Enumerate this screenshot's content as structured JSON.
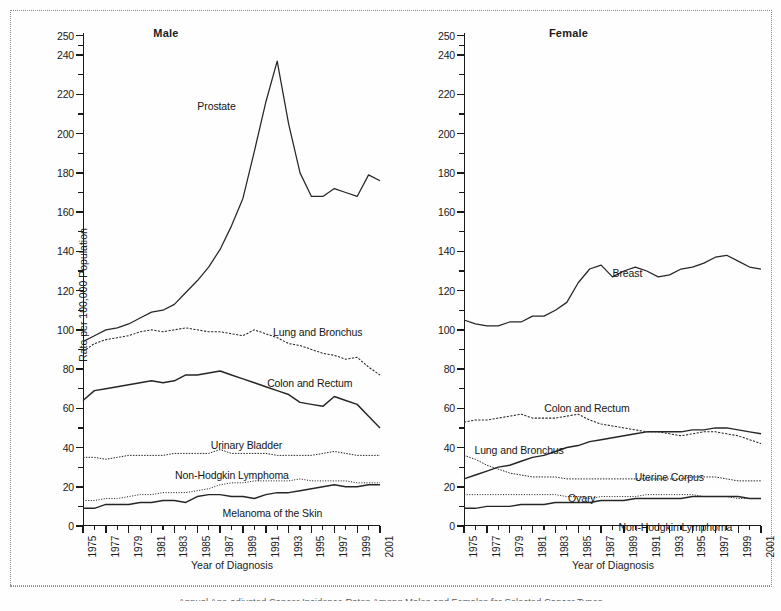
{
  "figure": {
    "caption": "Annual Age-adjusted Cancer Incidence Rates Among Males and Females for Selected Cancer Types",
    "y_axis_title": "Rate per 100,000 Population",
    "x_axis_title": "Year of Diagnosis",
    "panels": [
      {
        "title": "Male"
      },
      {
        "title": "Female"
      }
    ],
    "y_ticks": [
      "0",
      "20",
      "40",
      "60",
      "80",
      "100",
      "120",
      "140",
      "160",
      "180",
      "200",
      "220",
      "240",
      "250"
    ],
    "x_ticks": [
      "1975",
      "1977",
      "1979",
      "1981",
      "1983",
      "1985",
      "1987",
      "1989",
      "1991",
      "1993",
      "1995",
      "1997",
      "1999",
      "2001"
    ]
  },
  "chart_data": [
    {
      "type": "line",
      "title": "Male",
      "xlabel": "Year of Diagnosis",
      "ylabel": "Rate per 100,000 Population",
      "xlim": [
        1975,
        2001
      ],
      "ylim": [
        0,
        250
      ],
      "grid": false,
      "legend": "inline-labels",
      "x": [
        1975,
        1976,
        1977,
        1978,
        1979,
        1980,
        1981,
        1982,
        1983,
        1984,
        1985,
        1986,
        1987,
        1988,
        1989,
        1990,
        1991,
        1992,
        1993,
        1994,
        1995,
        1996,
        1997,
        1998,
        1999,
        2000,
        2001
      ],
      "series": [
        {
          "name": "Prostate",
          "label": "Prostate",
          "values": [
            94,
            97,
            100,
            101,
            103,
            106,
            109,
            110,
            113,
            119,
            125,
            132,
            141,
            153,
            167,
            191,
            216,
            237,
            205,
            180,
            168,
            168,
            172,
            170,
            168,
            179,
            176
          ]
        },
        {
          "name": "Lung and Bronchus",
          "label": "Lung and Bronchus",
          "values": [
            89,
            93,
            95,
            96,
            97,
            99,
            100,
            99,
            100,
            101,
            100,
            99,
            99,
            98,
            97,
            100,
            98,
            96,
            93,
            92,
            90,
            88,
            87,
            85,
            86,
            81,
            77
          ]
        },
        {
          "name": "Colon and Rectum",
          "label": "Colon and Rectum",
          "values": [
            64,
            69,
            70,
            71,
            72,
            73,
            74,
            73,
            74,
            77,
            77,
            78,
            79,
            77,
            75,
            73,
            71,
            69,
            67,
            63,
            62,
            61,
            66,
            64,
            62,
            56,
            50
          ]
        },
        {
          "name": "Urinary Bladder",
          "label": "Urinary Bladder",
          "values": [
            35,
            35,
            34,
            35,
            36,
            36,
            36,
            36,
            37,
            37,
            37,
            37,
            39,
            37,
            37,
            37,
            37,
            36,
            36,
            36,
            36,
            37,
            38,
            37,
            36,
            36,
            36
          ]
        },
        {
          "name": "Non-Hodgkin Lymphoma",
          "label": "Non-Hodgkin Lymphoma",
          "values": [
            13,
            13,
            14,
            14,
            15,
            16,
            16,
            17,
            17,
            17,
            18,
            19,
            21,
            22,
            22,
            23,
            23,
            23,
            23,
            24,
            23,
            23,
            23,
            23,
            22,
            22,
            22
          ]
        },
        {
          "name": "Melanoma of the Skin",
          "label": "Melanoma of the Skin",
          "values": [
            9,
            9,
            11,
            11,
            11,
            12,
            12,
            13,
            13,
            12,
            15,
            16,
            16,
            15,
            15,
            14,
            16,
            17,
            17,
            18,
            19,
            20,
            21,
            20,
            20,
            21,
            21
          ]
        }
      ]
    },
    {
      "type": "line",
      "title": "Female",
      "xlabel": "Year of Diagnosis",
      "ylabel": "Rate per 100,000 Population",
      "xlim": [
        1975,
        2001
      ],
      "ylim": [
        0,
        250
      ],
      "grid": false,
      "legend": "inline-labels",
      "x": [
        1975,
        1976,
        1977,
        1978,
        1979,
        1980,
        1981,
        1982,
        1983,
        1984,
        1985,
        1986,
        1987,
        1988,
        1989,
        1990,
        1991,
        1992,
        1993,
        1994,
        1995,
        1996,
        1997,
        1998,
        1999,
        2000,
        2001
      ],
      "series": [
        {
          "name": "Breast",
          "label": "Breast",
          "values": [
            105,
            103,
            102,
            102,
            104,
            104,
            107,
            107,
            110,
            114,
            124,
            131,
            133,
            127,
            130,
            132,
            130,
            127,
            128,
            131,
            132,
            134,
            137,
            138,
            135,
            132,
            131
          ]
        },
        {
          "name": "Colon and Rectum",
          "label": "Colon and Rectum",
          "values": [
            53,
            54,
            54,
            55,
            56,
            57,
            55,
            55,
            55,
            56,
            57,
            54,
            52,
            51,
            50,
            49,
            48,
            48,
            47,
            46,
            47,
            48,
            48,
            47,
            46,
            44,
            42
          ]
        },
        {
          "name": "Lung and Bronchus",
          "label": "Lung and Bronchus",
          "values": [
            24,
            26,
            28,
            30,
            31,
            33,
            35,
            36,
            38,
            40,
            41,
            43,
            44,
            45,
            46,
            47,
            48,
            48,
            48,
            48,
            49,
            49,
            50,
            50,
            49,
            48,
            47
          ]
        },
        {
          "name": "Uterine Corpus",
          "label": "Uterine Corpus",
          "values": [
            36,
            34,
            31,
            29,
            27,
            26,
            25,
            25,
            25,
            24,
            24,
            24,
            24,
            24,
            24,
            24,
            24,
            24,
            24,
            24,
            25,
            25,
            25,
            24,
            23,
            23,
            23
          ]
        },
        {
          "name": "Ovary",
          "label": "Ovary",
          "values": [
            16,
            16,
            16,
            16,
            16,
            16,
            16,
            16,
            16,
            15,
            15,
            14,
            15,
            15,
            15,
            15,
            16,
            16,
            16,
            16,
            16,
            15,
            15,
            15,
            14,
            14,
            14
          ]
        },
        {
          "name": "Non-Hodgkin Lymphoma",
          "label": "Non-Hodgkin Lymphoma",
          "values": [
            9,
            9,
            10,
            10,
            10,
            11,
            11,
            11,
            12,
            12,
            12,
            12,
            13,
            13,
            13,
            14,
            14,
            14,
            14,
            14,
            15,
            15,
            15,
            15,
            15,
            14,
            14
          ]
        }
      ]
    }
  ]
}
